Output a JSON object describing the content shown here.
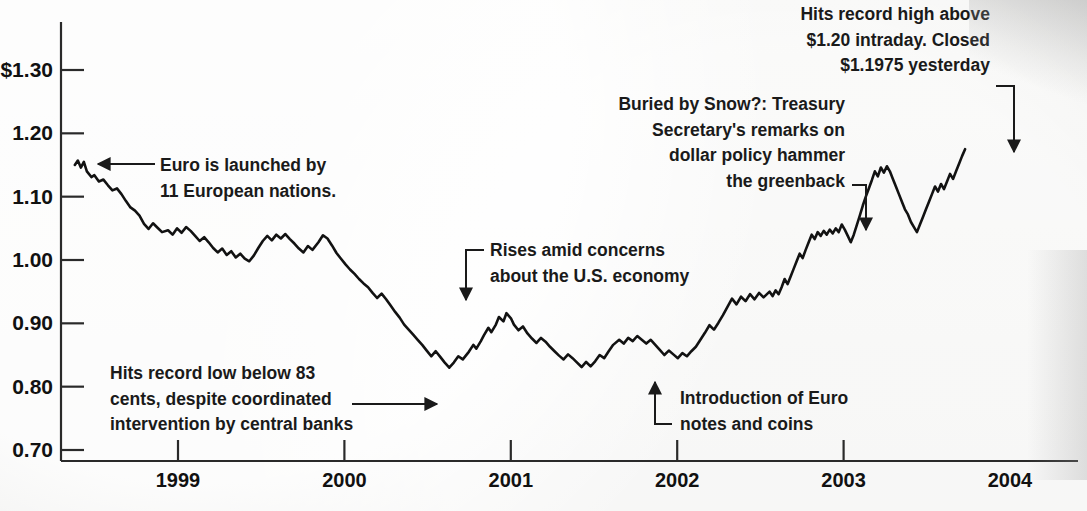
{
  "chart_data": {
    "type": "line",
    "title": "",
    "xlabel": "",
    "ylabel": "",
    "ylim": [
      0.7,
      1.3635
    ],
    "xlim": [
      1998.37,
      2004.0
    ],
    "grid": false,
    "legend": "none",
    "y_ticks": [
      "$1.30",
      "1.20",
      "1.10",
      "1.00",
      "0.90",
      "0.80",
      "0.70"
    ],
    "y_tick_values": [
      1.3,
      1.2,
      1.1,
      1.0,
      0.9,
      0.8,
      0.7
    ],
    "x_ticks": [
      "1999",
      "2000",
      "2001",
      "2002",
      "2003",
      "2004"
    ],
    "x_tick_values": [
      1999,
      2000,
      2001,
      2002,
      2003,
      2004
    ],
    "series": [
      {
        "name": "Euro vs. U.S. dollar",
        "points": [
          [
            1998.38,
            1.15
          ],
          [
            1998.4,
            1.157
          ],
          [
            1998.42,
            1.146
          ],
          [
            1998.44,
            1.155
          ],
          [
            1998.46,
            1.14
          ],
          [
            1998.49,
            1.131
          ],
          [
            1998.51,
            1.134
          ],
          [
            1998.54,
            1.124
          ],
          [
            1998.57,
            1.127
          ],
          [
            1998.6,
            1.118
          ],
          [
            1998.63,
            1.11
          ],
          [
            1998.66,
            1.113
          ],
          [
            1998.69,
            1.104
          ],
          [
            1998.72,
            1.093
          ],
          [
            1998.75,
            1.083
          ],
          [
            1998.78,
            1.078
          ],
          [
            1998.81,
            1.07
          ],
          [
            1998.84,
            1.057
          ],
          [
            1998.87,
            1.049
          ],
          [
            1998.9,
            1.058
          ],
          [
            1998.93,
            1.051
          ],
          [
            1998.96,
            1.044
          ],
          [
            1999.0,
            1.047
          ],
          [
            1999.03,
            1.04
          ],
          [
            1999.06,
            1.05
          ],
          [
            1999.09,
            1.043
          ],
          [
            1999.12,
            1.052
          ],
          [
            1999.15,
            1.046
          ],
          [
            1999.18,
            1.038
          ],
          [
            1999.21,
            1.03
          ],
          [
            1999.24,
            1.036
          ],
          [
            1999.27,
            1.028
          ],
          [
            1999.3,
            1.019
          ],
          [
            1999.33,
            1.012
          ],
          [
            1999.36,
            1.018
          ],
          [
            1999.39,
            1.008
          ],
          [
            1999.42,
            1.014
          ],
          [
            1999.45,
            1.004
          ],
          [
            1999.48,
            1.01
          ],
          [
            1999.51,
            1.002
          ],
          [
            1999.54,
            0.998
          ],
          [
            1999.57,
            1.007
          ],
          [
            1999.6,
            1.019
          ],
          [
            1999.63,
            1.03
          ],
          [
            1999.66,
            1.038
          ],
          [
            1999.69,
            1.031
          ],
          [
            1999.72,
            1.04
          ],
          [
            1999.75,
            1.034
          ],
          [
            1999.78,
            1.041
          ],
          [
            1999.81,
            1.033
          ],
          [
            1999.84,
            1.026
          ],
          [
            1999.87,
            1.018
          ],
          [
            1999.9,
            1.012
          ],
          [
            1999.93,
            1.022
          ],
          [
            1999.96,
            1.016
          ],
          [
            2000.0,
            1.028
          ],
          [
            2000.03,
            1.039
          ],
          [
            2000.06,
            1.034
          ],
          [
            2000.09,
            1.023
          ],
          [
            2000.12,
            1.011
          ],
          [
            2000.15,
            1.002
          ],
          [
            2000.18,
            0.993
          ],
          [
            2000.21,
            0.985
          ],
          [
            2000.24,
            0.978
          ],
          [
            2000.27,
            0.97
          ],
          [
            2000.3,
            0.963
          ],
          [
            2000.33,
            0.957
          ],
          [
            2000.36,
            0.948
          ],
          [
            2000.39,
            0.94
          ],
          [
            2000.42,
            0.947
          ],
          [
            2000.45,
            0.938
          ],
          [
            2000.48,
            0.928
          ],
          [
            2000.51,
            0.918
          ],
          [
            2000.54,
            0.909
          ],
          [
            2000.57,
            0.898
          ],
          [
            2000.6,
            0.89
          ],
          [
            2000.63,
            0.882
          ],
          [
            2000.66,
            0.874
          ],
          [
            2000.69,
            0.866
          ],
          [
            2000.72,
            0.857
          ],
          [
            2000.75,
            0.848
          ],
          [
            2000.78,
            0.856
          ],
          [
            2000.81,
            0.847
          ],
          [
            2000.84,
            0.838
          ],
          [
            2000.87,
            0.83
          ],
          [
            2000.9,
            0.838
          ],
          [
            2000.93,
            0.848
          ],
          [
            2000.96,
            0.843
          ],
          [
            2001.0,
            0.855
          ],
          [
            2001.03,
            0.866
          ],
          [
            2001.05,
            0.86
          ],
          [
            2001.08,
            0.872
          ],
          [
            2001.1,
            0.881
          ],
          [
            2001.13,
            0.893
          ],
          [
            2001.15,
            0.886
          ],
          [
            2001.18,
            0.898
          ],
          [
            2001.2,
            0.91
          ],
          [
            2001.23,
            0.903
          ],
          [
            2001.25,
            0.916
          ],
          [
            2001.28,
            0.908
          ],
          [
            2001.3,
            0.898
          ],
          [
            2001.33,
            0.889
          ],
          [
            2001.36,
            0.895
          ],
          [
            2001.39,
            0.884
          ],
          [
            2001.42,
            0.876
          ],
          [
            2001.45,
            0.869
          ],
          [
            2001.48,
            0.877
          ],
          [
            2001.51,
            0.871
          ],
          [
            2001.54,
            0.863
          ],
          [
            2001.57,
            0.856
          ],
          [
            2001.6,
            0.849
          ],
          [
            2001.63,
            0.843
          ],
          [
            2001.66,
            0.851
          ],
          [
            2001.69,
            0.845
          ],
          [
            2001.72,
            0.838
          ],
          [
            2001.75,
            0.831
          ],
          [
            2001.78,
            0.839
          ],
          [
            2001.81,
            0.832
          ],
          [
            2001.84,
            0.84
          ],
          [
            2001.87,
            0.85
          ],
          [
            2001.9,
            0.845
          ],
          [
            2001.93,
            0.856
          ],
          [
            2001.96,
            0.866
          ],
          [
            2002.0,
            0.874
          ],
          [
            2002.03,
            0.868
          ],
          [
            2002.06,
            0.877
          ],
          [
            2002.09,
            0.872
          ],
          [
            2002.12,
            0.88
          ],
          [
            2002.15,
            0.874
          ],
          [
            2002.18,
            0.868
          ],
          [
            2002.21,
            0.874
          ],
          [
            2002.24,
            0.866
          ],
          [
            2002.27,
            0.858
          ],
          [
            2002.3,
            0.85
          ],
          [
            2002.33,
            0.857
          ],
          [
            2002.36,
            0.851
          ],
          [
            2002.39,
            0.845
          ],
          [
            2002.42,
            0.853
          ],
          [
            2002.45,
            0.848
          ],
          [
            2002.48,
            0.856
          ],
          [
            2002.51,
            0.863
          ],
          [
            2002.54,
            0.874
          ],
          [
            2002.57,
            0.885
          ],
          [
            2002.6,
            0.897
          ],
          [
            2002.63,
            0.89
          ],
          [
            2002.66,
            0.901
          ],
          [
            2002.69,
            0.913
          ],
          [
            2002.72,
            0.926
          ],
          [
            2002.75,
            0.939
          ],
          [
            2002.78,
            0.93
          ],
          [
            2002.81,
            0.942
          ],
          [
            2002.84,
            0.935
          ],
          [
            2002.87,
            0.946
          ],
          [
            2002.9,
            0.938
          ],
          [
            2002.93,
            0.948
          ],
          [
            2002.96,
            0.941
          ],
          [
            2003.0,
            0.95
          ],
          [
            2003.02,
            0.943
          ],
          [
            2003.04,
            0.952
          ],
          [
            2003.06,
            0.946
          ],
          [
            2003.08,
            0.957
          ],
          [
            2003.1,
            0.97
          ],
          [
            2003.12,
            0.962
          ],
          [
            2003.14,
            0.974
          ],
          [
            2003.16,
            0.986
          ],
          [
            2003.18,
            0.998
          ],
          [
            2003.2,
            1.01
          ],
          [
            2003.22,
            1.003
          ],
          [
            2003.24,
            1.016
          ],
          [
            2003.26,
            1.028
          ],
          [
            2003.28,
            1.04
          ],
          [
            2003.3,
            1.033
          ],
          [
            2003.32,
            1.044
          ],
          [
            2003.34,
            1.038
          ],
          [
            2003.36,
            1.046
          ],
          [
            2003.38,
            1.04
          ],
          [
            2003.4,
            1.048
          ],
          [
            2003.42,
            1.042
          ],
          [
            2003.44,
            1.05
          ],
          [
            2003.46,
            1.044
          ],
          [
            2003.48,
            1.056
          ],
          [
            2003.5,
            1.048
          ],
          [
            2003.52,
            1.038
          ],
          [
            2003.54,
            1.028
          ],
          [
            2003.56,
            1.04
          ],
          [
            2003.58,
            1.055
          ],
          [
            2003.6,
            1.07
          ],
          [
            2003.62,
            1.086
          ],
          [
            2003.64,
            1.1
          ],
          [
            2003.66,
            1.113
          ],
          [
            2003.68,
            1.126
          ],
          [
            2003.7,
            1.14
          ],
          [
            2003.72,
            1.132
          ],
          [
            2003.74,
            1.146
          ],
          [
            2003.76,
            1.138
          ],
          [
            2003.78,
            1.148
          ],
          [
            2003.8,
            1.14
          ],
          [
            2003.82,
            1.128
          ],
          [
            2003.84,
            1.116
          ],
          [
            2003.86,
            1.104
          ],
          [
            2003.88,
            1.092
          ],
          [
            2003.9,
            1.08
          ],
          [
            2003.92,
            1.072
          ],
          [
            2003.94,
            1.06
          ],
          [
            2003.96,
            1.052
          ],
          [
            2003.98,
            1.044
          ],
          [
            2004.0,
            1.056
          ],
          [
            2004.02,
            1.068
          ],
          [
            2004.04,
            1.08
          ],
          [
            2004.06,
            1.092
          ],
          [
            2004.08,
            1.104
          ],
          [
            2004.1,
            1.116
          ],
          [
            2004.12,
            1.108
          ],
          [
            2004.14,
            1.12
          ],
          [
            2004.16,
            1.112
          ],
          [
            2004.18,
            1.124
          ],
          [
            2004.2,
            1.136
          ],
          [
            2004.22,
            1.128
          ],
          [
            2004.24,
            1.14
          ],
          [
            2004.26,
            1.152
          ],
          [
            2004.28,
            1.164
          ],
          [
            2004.3,
            1.175
          ]
        ]
      }
    ],
    "annotations": [
      {
        "id": "euro-launch",
        "lines": [
          "Euro is launched by",
          "11 European nations."
        ],
        "align": "left",
        "target_value": 1.152,
        "target_year": 1998.4
      },
      {
        "id": "record-low",
        "lines": [
          "Hits record low below 83",
          "cents, despite coordinated",
          "intervention by central banks"
        ],
        "align": "center",
        "target_value": 0.83,
        "target_year": 2000.87
      },
      {
        "id": "rises-amid-concerns",
        "lines": [
          "Rises amid concerns",
          "about the U.S. economy"
        ],
        "align": "left",
        "target_value": 0.916,
        "target_year": 2001.25
      },
      {
        "id": "euro-notes-coins",
        "lines": [
          "Introduction of Euro",
          "notes and coins"
        ],
        "align": "left",
        "target_value": 0.845,
        "target_year": 2001.63
      },
      {
        "id": "snow-remarks",
        "lines": [
          "Buried by Snow?: Treasury",
          "Secretary's remarks on",
          "dollar policy hammer",
          "the greenback"
        ],
        "align": "right",
        "target_value": 1.046,
        "target_year": 2003.38
      },
      {
        "id": "record-high",
        "lines": [
          "Hits record high above",
          "$1.20 intraday. Closed",
          "$1.1975 yesterday"
        ],
        "align": "right",
        "target_value": 1.175,
        "target_year": 2004.3
      }
    ]
  },
  "cut_off_header": ""
}
